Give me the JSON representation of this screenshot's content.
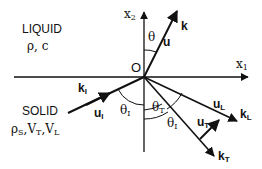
{
  "regions": {
    "liquid": {
      "name": "LIQUID",
      "params": "ρ, c"
    },
    "solid": {
      "name": "SOLID",
      "params_rho": "ρ",
      "params_rho_sub": "S",
      "params_vt": "V",
      "params_vt_sub": "T",
      "params_vl": "V",
      "params_vl_sub": "L"
    }
  },
  "axes": {
    "x1": {
      "base": "x",
      "sub": "1"
    },
    "x2": {
      "base": "x",
      "sub": "2"
    },
    "origin": "O"
  },
  "vectors": {
    "k": {
      "label": "k"
    },
    "u": {
      "label": "u"
    },
    "kI": {
      "base": "k",
      "sub": "I"
    },
    "uI": {
      "base": "u",
      "sub": "I"
    },
    "kL": {
      "base": "k",
      "sub": "L"
    },
    "uL": {
      "base": "u",
      "sub": "L"
    },
    "kT": {
      "base": "k",
      "sub": "T"
    },
    "uT": {
      "base": "u",
      "sub": "T"
    }
  },
  "angles": {
    "theta": "θ",
    "thetaI_left": {
      "base": "θ",
      "sub": "I"
    },
    "thetaT": {
      "base": "θ",
      "sub": "T"
    },
    "thetaI_right": {
      "base": "θ",
      "sub": "I"
    }
  },
  "colors": {
    "ink": "#111111",
    "background": "#ffffff"
  }
}
